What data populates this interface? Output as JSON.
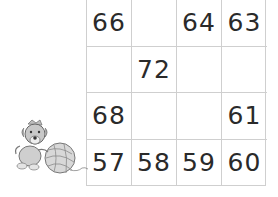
{
  "puzzle": {
    "rows": [
      [
        "66",
        "",
        "64",
        "63"
      ],
      [
        "",
        "72",
        "",
        ""
      ],
      [
        "68",
        "",
        "",
        "61"
      ],
      [
        "57",
        "58",
        "59",
        "60"
      ]
    ]
  },
  "illustration": {
    "icon": "dog-with-yarn-ball-icon"
  }
}
